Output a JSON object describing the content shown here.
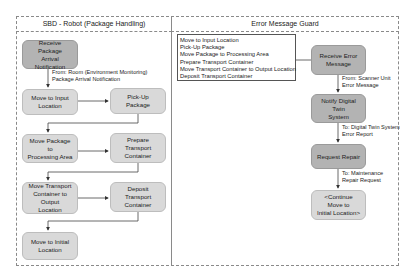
{
  "lanes": [
    {
      "title": "SBD - Robot (Package Handling)"
    },
    {
      "title": "Error Message Guard"
    }
  ],
  "left_lane": {
    "nodes": [
      {
        "id": "receive_package",
        "label_lines": [
          "Receive Package",
          "Arrival Notification"
        ],
        "style": "dark"
      },
      {
        "id": "move_to_input",
        "label_lines": [
          "Move to Input",
          "Location"
        ],
        "style": "light"
      },
      {
        "id": "pick_up",
        "label_lines": [
          "Pick-Up Package"
        ],
        "style": "light"
      },
      {
        "id": "move_to_processing",
        "label_lines": [
          "Move Package to",
          "Processing Area"
        ],
        "style": "light"
      },
      {
        "id": "prepare_container",
        "label_lines": [
          "Prepare Transport",
          "Container"
        ],
        "style": "light"
      },
      {
        "id": "move_container_output",
        "label_lines": [
          "Move Transport",
          "Container to Output",
          "Location"
        ],
        "style": "light"
      },
      {
        "id": "deposit_container",
        "label_lines": [
          "Deposit Transport",
          "Container"
        ],
        "style": "light"
      },
      {
        "id": "move_initial",
        "label_lines": [
          "Move to Initial",
          "Location"
        ],
        "style": "light"
      }
    ],
    "edge_labels": [
      {
        "lines": [
          "From: Room (Environment Monitoring)",
          "Package Arrival Notification"
        ]
      }
    ]
  },
  "right_lane": {
    "note": {
      "lines": [
        "Move to Input Location",
        "Pick-Up Package",
        "Move Package to Processing Area",
        "Prepare Transport Container",
        "Move Transport Container to Output Location",
        "Deposit Transport Container"
      ]
    },
    "nodes": [
      {
        "id": "receive_error",
        "label_lines": [
          "Receive Error",
          "Message"
        ],
        "style": "dark"
      },
      {
        "id": "notify_twin",
        "label_lines": [
          "Notify Digital Twin",
          "System"
        ],
        "style": "dark"
      },
      {
        "id": "request_repair",
        "label_lines": [
          "Request Repair"
        ],
        "style": "dark"
      },
      {
        "id": "continue_move",
        "label_lines": [
          "<Continue Move to",
          "Initial Location>"
        ],
        "style": "light"
      }
    ],
    "edge_labels": [
      {
        "lines": [
          "From: Scanner Unit",
          "Error Message"
        ]
      },
      {
        "lines": [
          "To: Digital Twin System",
          "Error Report"
        ]
      },
      {
        "lines": [
          "To: Maintenance",
          "Repair Request"
        ]
      }
    ]
  }
}
